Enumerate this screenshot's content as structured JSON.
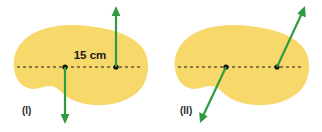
{
  "figure": {
    "background_color": "#ffffff",
    "blob_fill_color": "#F7D86B",
    "arrow_color": "#2E9B3F",
    "axis_color": "#1a1a1a",
    "dot_color": "#111111",
    "text_color": "#1a1a1a"
  },
  "panels": [
    {
      "id": "panel-one",
      "label": "(I)",
      "label_x": 22,
      "label_y": 114,
      "blob_path": "M 14 68 C 12 54 20 40 34 33 C 50 25 70 24 88 26 C 108 28 128 33 140 45 C 150 55 150 72 144 84 C 137 97 120 104 104 105 C 88 106 74 102 66 96 C 60 91 56 86 50 86 C 42 86 36 91 28 88 C 19 85 15 77 14 68 Z",
      "axis": {
        "x1": 17,
        "y1": 67,
        "x2": 143,
        "y2": 67,
        "dash": "3 3",
        "width": 1.2
      },
      "dots": [
        {
          "name": "pivot-dot-left",
          "cx": 65,
          "cy": 67,
          "r": 2.6
        },
        {
          "name": "pivot-dot-right",
          "cx": 116,
          "cy": 67,
          "r": 2.6
        }
      ],
      "arrows": [
        {
          "name": "force-arrow-up",
          "x1": 116,
          "y1": 67,
          "x2": 116,
          "y2": 12,
          "width": 2.2,
          "head": "116,6 111.6,16 120.4,16"
        },
        {
          "name": "force-arrow-down",
          "x1": 65,
          "y1": 67,
          "x2": 65,
          "y2": 118,
          "width": 2.2,
          "head": "65,124 60.6,114 69.4,114"
        }
      ],
      "measurement": {
        "text": "15 cm",
        "x": 90,
        "y": 59
      }
    },
    {
      "id": "panel-two",
      "label": "(II)",
      "label_x": 180,
      "label_y": 114,
      "blob_path": "M 175 68 C 173 54 181 40 195 33 C 211 25 231 24 249 26 C 269 28 289 33 301 45 C 311 55 311 72 305 84 C 298 97 281 104 265 105 C 249 106 235 102 227 96 C 221 91 217 86 211 86 C 203 86 197 91 189 88 C 180 85 176 77 175 68 Z",
      "axis": {
        "x1": 178,
        "y1": 67,
        "x2": 304,
        "y2": 67,
        "dash": "3 3",
        "width": 1.2
      },
      "dots": [
        {
          "name": "pivot-dot-left",
          "cx": 226,
          "cy": 67,
          "r": 2.6
        },
        {
          "name": "pivot-dot-right",
          "cx": 277,
          "cy": 67,
          "r": 2.6
        }
      ],
      "arrows": [
        {
          "name": "force-arrow-up-right",
          "x1": 277,
          "y1": 67,
          "x2": 302,
          "y2": 13,
          "width": 2.2,
          "head": "305,6 297.3,13.6 305.8,17.5"
        },
        {
          "name": "force-arrow-down-left",
          "x1": 226,
          "y1": 67,
          "x2": 203,
          "y2": 116,
          "width": 2.2,
          "head": "200,123 199.2,112.3 207.7,116.2"
        }
      ]
    }
  ]
}
